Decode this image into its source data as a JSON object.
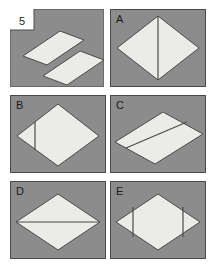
{
  "figure": {
    "item_number": "5",
    "panel_fill": "#8c8c8c",
    "panel_border": "#4a4a4a",
    "shape_fill": "#ebebe7",
    "shape_stroke": "#4a4a4a",
    "background": "#ffffff"
  },
  "panels": [
    {
      "id": "panel-5",
      "label": "5",
      "label_placement": "notch",
      "description": "two separated parallelogram strips",
      "shapes": [
        {
          "name": "parallelogram-upper",
          "type": "polygon",
          "points": "23,56 60,31 84,40 47,65"
        },
        {
          "name": "parallelogram-lower",
          "type": "polygon",
          "points": "43,76 80,51 104,60 67,85"
        }
      ],
      "lines": []
    },
    {
      "id": "panel-a",
      "label": "A",
      "label_placement": "inside",
      "description": "rhombus divided by a vertical centre line",
      "shapes": [
        {
          "name": "rhombus",
          "type": "polygon",
          "points": "157,22 201,50 157,78 113,50"
        }
      ],
      "lines": [
        {
          "name": "vertical-centre-line",
          "x1": 157,
          "y1": 22,
          "x2": 157,
          "y2": 78
        }
      ]
    },
    {
      "id": "panel-b",
      "label": "B",
      "label_placement": "inside",
      "description": "rhombus divided by an off-centre vertical line near the left vertex",
      "shapes": [
        {
          "name": "rhombus",
          "type": "polygon",
          "points": "58,108 102,136 58,164 14,136"
        }
      ],
      "lines": [
        {
          "name": "vertical-offset-line",
          "x1": 33,
          "y1": 120,
          "x2": 33,
          "y2": 152
        }
      ]
    },
    {
      "id": "panel-c",
      "label": "C",
      "label_placement": "inside",
      "description": "rhombus divided by a slanted line parallel to its edges",
      "shapes": [
        {
          "name": "rhombus",
          "type": "polygon",
          "points": "162,112 203,134 155,163 114,141"
        }
      ],
      "lines": [
        {
          "name": "slanted-divider-line",
          "x1": 125,
          "y1": 147,
          "x2": 186,
          "y2": 121
        }
      ]
    },
    {
      "id": "panel-d",
      "label": "D",
      "label_placement": "inside",
      "description": "rhombus divided by a horizontal centre line",
      "shapes": [
        {
          "name": "rhombus",
          "type": "polygon",
          "points": "58,194 100,221 58,249 16,221"
        }
      ],
      "lines": [
        {
          "name": "horizontal-centre-line",
          "x1": 16,
          "y1": 221,
          "x2": 100,
          "y2": 221
        }
      ]
    },
    {
      "id": "panel-e",
      "label": "E",
      "label_placement": "inside",
      "description": "rhombus divided by two symmetric vertical lines",
      "shapes": [
        {
          "name": "rhombus",
          "type": "polygon",
          "points": "157,194 199,221 157,249 115,221}"
        }
      ],
      "lines": [
        {
          "name": "vertical-line-left",
          "x1": 133,
          "y1": 206,
          "x2": 133,
          "y2": 236
        },
        {
          "name": "vertical-line-right",
          "x1": 181,
          "y1": 206,
          "x2": 181,
          "y2": 236
        }
      ]
    }
  ]
}
